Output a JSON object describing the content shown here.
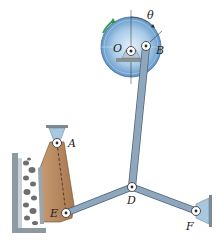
{
  "labels": {
    "O": "O",
    "B": "B",
    "A": "A",
    "D": "D",
    "E": "E",
    "F": "F",
    "theta": "θ"
  },
  "colors": {
    "link": "#8fa7bd",
    "link_stroke": "#4f6478",
    "disk_outer": "#5f97c9",
    "disk_inner": "#cfe3f3",
    "plate": "#b98a62",
    "plate_stroke": "#6b4a2f",
    "support": "#a8c8df",
    "wall": "#9aa6ad",
    "rotation_arrow": "#2f9a45",
    "gravel": "#6e6e72"
  }
}
